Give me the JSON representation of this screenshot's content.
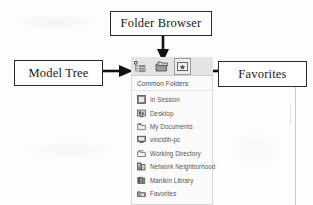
{
  "figure": {
    "type": "annotated-screenshot",
    "callouts": [
      {
        "id": "folder-browser",
        "label": "Folder Browser",
        "arrow": "down",
        "points_to": "folder-browser-toolbar-button"
      },
      {
        "id": "model-tree",
        "label": "Model Tree",
        "arrow": "right",
        "points_to": "model-tree-toolbar-button"
      },
      {
        "id": "favorites",
        "label": "Favorites",
        "arrow": "left",
        "points_to": "favorites-toolbar-button"
      }
    ]
  },
  "app": {
    "toolbar": {
      "buttons": [
        {
          "name": "model-tree-icon",
          "title": "Model Tree"
        },
        {
          "name": "folder-browser-icon",
          "title": "Folder Browser"
        },
        {
          "name": "favorites-icon",
          "title": "Favorites"
        }
      ]
    },
    "folder_browser": {
      "section_title": "Common Folders",
      "items": [
        {
          "icon": "in-session-icon",
          "label": "In Session"
        },
        {
          "icon": "desktop-icon",
          "label": "Desktop"
        },
        {
          "icon": "my-documents-icon",
          "label": "My Documents"
        },
        {
          "icon": "computer-icon",
          "label": "vincidih-pc"
        },
        {
          "icon": "working-directory-icon",
          "label": "Working Directory"
        },
        {
          "icon": "network-neighborhood-icon",
          "label": "Network Neighborhood"
        },
        {
          "icon": "manikin-library-icon",
          "label": "Manikin Library"
        },
        {
          "icon": "favorites-folder-icon",
          "label": "Favorites"
        }
      ]
    }
  },
  "colors": {
    "callout_border": "#2b2b2b",
    "arrow": "#111111",
    "toolbar_bg": "#e4e4e4",
    "panel_bg": "#fbfbfb",
    "item_text": "#555555"
  }
}
